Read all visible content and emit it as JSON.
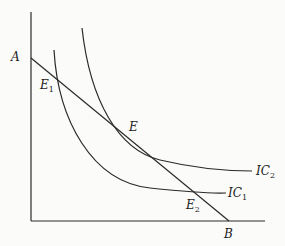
{
  "diagram": {
    "type": "indifference-curve-budget-line",
    "axes": {
      "origin": [
        31,
        221
      ],
      "y_top": [
        31,
        12
      ],
      "x_right": [
        265,
        221
      ]
    },
    "budget_line": {
      "start_label": "A",
      "end_label": "B",
      "start": [
        31,
        58
      ],
      "end": [
        229,
        221
      ]
    },
    "curves": [
      {
        "name": "IC",
        "sub": "1",
        "path": "M54,50 C60,120 90,180 150,188 S210,193 226,193",
        "label_pos": [
          230,
          197
        ]
      },
      {
        "name": "IC",
        "sub": "2",
        "path": "M82,28 C92,100 120,150 160,160 S230,171 252,171",
        "label_pos": [
          257,
          175
        ]
      }
    ],
    "points": [
      {
        "name": "E",
        "sub": "1",
        "label_pos": [
          40,
          89
        ]
      },
      {
        "name": "E",
        "sub": "",
        "label_pos": [
          129,
          131
        ]
      },
      {
        "name": "E",
        "sub": "2",
        "label_pos": [
          186,
          208
        ]
      }
    ],
    "labels": {
      "A": "A",
      "B": "B",
      "E1": "E",
      "E1_sub": "1",
      "E": "E",
      "E2": "E",
      "E2_sub": "2",
      "IC1": "IC",
      "IC1_sub": "1",
      "IC2": "IC",
      "IC2_sub": "2"
    }
  }
}
